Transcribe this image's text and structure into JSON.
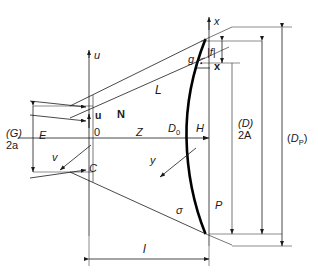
{
  "figure": {
    "type": "technical-line-diagram",
    "background_color": "#ffffff",
    "line_color": "#1a1a1a",
    "mirror_color": "#000000"
  },
  "axes": {
    "vertical_left_top_label": "u",
    "vertical_right_top_label": "x",
    "origin_label": "0",
    "horizontal_axis_left_label": "E",
    "horizontal_axis_mid_label": "Z"
  },
  "labels": {
    "u_axis": "u",
    "x_axis": "x",
    "u_vector": "u",
    "x_vector": "x",
    "N_vector": "N",
    "v_vector": "v",
    "y_vector": "y",
    "origin": "0",
    "E": "E",
    "Z": "Z",
    "L": "L",
    "g_angle": "g",
    "f_abs": "|f|",
    "C": "C",
    "H": "H",
    "P": "P",
    "sigma": "σ",
    "l_length": "l",
    "D0": {
      "base": "D",
      "sub": "0"
    },
    "DP": {
      "base": "D",
      "sub": "P"
    }
  },
  "dimensions": [
    {
      "name": "aperture-left",
      "lines": [
        "(G)",
        "2a"
      ],
      "orientation": "vertical",
      "side": "left"
    },
    {
      "name": "aperture-right-inner",
      "lines": [
        "(D)",
        "2A"
      ],
      "orientation": "vertical",
      "side": "right"
    },
    {
      "name": "aperture-right-outer",
      "lines": [
        "(D_P)"
      ],
      "orientation": "vertical",
      "side": "right"
    },
    {
      "name": "axial-length",
      "lines": [
        "l"
      ],
      "orientation": "horizontal",
      "side": "bottom"
    }
  ],
  "markers": {
    "right_angle_symbol": "right-angle-dot-arc",
    "arrowheads": "solid-filled-triangles"
  }
}
